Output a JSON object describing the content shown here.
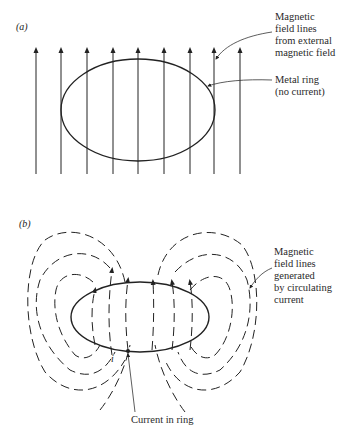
{
  "panels": [
    {
      "label": "(a)",
      "callouts": [
        {
          "text": "Magnetic\nfield lines\nfrom external\nmagnetic field"
        },
        {
          "text": "Metal ring\n(no current)"
        }
      ]
    },
    {
      "label": "(b)",
      "callouts": [
        {
          "text": "Magnetic\nfield lines\ngenerated\nby circulating\ncurrent"
        },
        {
          "text": "Current in ring"
        }
      ],
      "current_symbol": "i"
    }
  ],
  "colors": {
    "line": "#222222",
    "background": "#ffffff"
  }
}
